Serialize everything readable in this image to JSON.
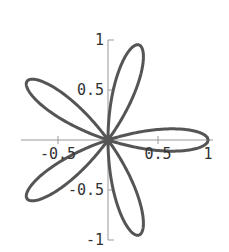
{
  "chart_data": {
    "type": "line",
    "subtype": "polar-rose",
    "title": "",
    "equation": "r = cos(5θ)",
    "petals": 5,
    "petal_angles_deg": [
      0,
      72,
      144,
      216,
      288
    ],
    "xlabel": "",
    "ylabel": "",
    "xlim": [
      -1,
      1
    ],
    "ylim": [
      -1,
      1
    ],
    "x_ticks": [
      -0.5,
      0.5,
      1
    ],
    "x_tick_labels": [
      "-0.5",
      "0.5",
      "1"
    ],
    "y_ticks": [
      1,
      0.5,
      -0.5,
      -1
    ],
    "y_tick_labels": [
      "1",
      "0.5",
      "-0.5",
      "-1"
    ],
    "grid": false,
    "legend": null,
    "series": [
      {
        "name": "rose",
        "color": "#555555"
      }
    ]
  },
  "layout": {
    "origin": [
      108,
      140
    ],
    "scale": 100,
    "curve_color": "#555555",
    "axis_color": "#999999"
  }
}
